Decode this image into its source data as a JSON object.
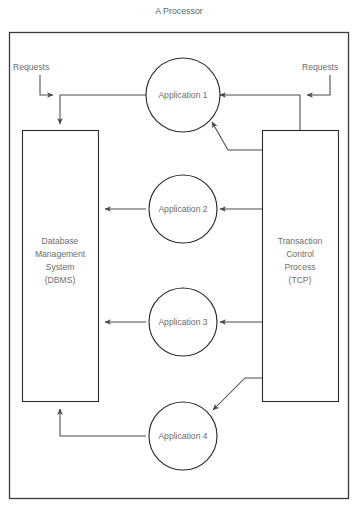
{
  "diagram": {
    "title": "A Processor",
    "type": "block-flow-diagram",
    "labels": {
      "requests_left": "Requests",
      "requests_right": "Requests"
    },
    "nodes": [
      {
        "id": "dbms",
        "shape": "rectangle",
        "lines": [
          "Database",
          "Management",
          "System",
          "(DBMS)"
        ]
      },
      {
        "id": "tcp",
        "shape": "rectangle",
        "lines": [
          "Transaction",
          "Control",
          "Process",
          "(TCP)"
        ]
      },
      {
        "id": "app1",
        "shape": "circle",
        "label": "Application 1"
      },
      {
        "id": "app2",
        "shape": "circle",
        "label": "Application 2"
      },
      {
        "id": "app3",
        "shape": "circle",
        "label": "Application 3"
      },
      {
        "id": "app4",
        "shape": "circle",
        "label": "Application 4"
      }
    ],
    "colors": {
      "stroke": "#2b2b2b",
      "connector": "#4a4a4a",
      "text": "#6d6d6d",
      "background": "#ffffff"
    }
  }
}
